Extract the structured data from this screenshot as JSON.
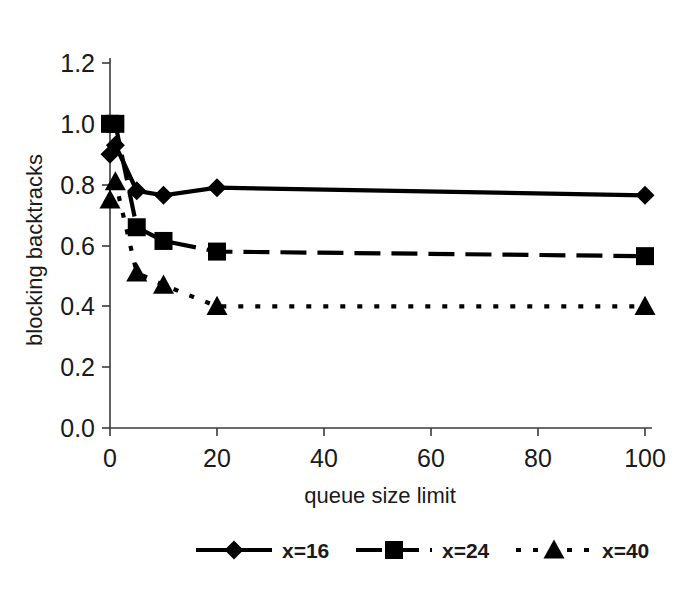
{
  "figure": {
    "background_color": "#ffffff",
    "ink_color": "#000000",
    "axis_color": "#3a3a3a"
  },
  "chart_data": {
    "type": "line",
    "title": "",
    "xlabel": "queue size limit",
    "ylabel": "blocking backtracks",
    "xlim": [
      0,
      100
    ],
    "ylim": [
      0.0,
      1.2
    ],
    "xticks": [
      0,
      20,
      40,
      60,
      80,
      100
    ],
    "xtick_labels": [
      "0",
      "20",
      "40",
      "60",
      "80",
      "100"
    ],
    "yticks": [
      0.0,
      0.2,
      0.4,
      0.6,
      0.8,
      1.0,
      1.2
    ],
    "ytick_labels": [
      "0.0",
      "0.2",
      "0.4",
      "0.6",
      "0.8",
      "1.0",
      "1.2"
    ],
    "grid": false,
    "legend_position": "below",
    "x": [
      0,
      1,
      5,
      10,
      20,
      100
    ],
    "series": [
      {
        "name": "x=16",
        "marker": "diamond",
        "linestyle": "solid",
        "values": [
          0.9,
          0.93,
          0.78,
          0.765,
          0.79,
          0.765
        ]
      },
      {
        "name": "x=24",
        "marker": "square",
        "linestyle": "dashed",
        "values": [
          1.0,
          1.0,
          0.66,
          0.615,
          0.58,
          0.565
        ]
      },
      {
        "name": "x=40",
        "marker": "triangle",
        "linestyle": "dotted",
        "values": [
          0.75,
          0.81,
          0.51,
          0.47,
          0.4,
          0.4
        ]
      }
    ]
  },
  "legend": {
    "entries": [
      {
        "label": "x=16",
        "marker": "diamond",
        "linestyle": "solid"
      },
      {
        "label": "x=24",
        "marker": "square",
        "linestyle": "dashed"
      },
      {
        "label": "x=40",
        "marker": "triangle",
        "linestyle": "dotted"
      }
    ]
  }
}
